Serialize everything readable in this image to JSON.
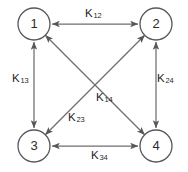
{
  "diagram": {
    "type": "graph",
    "background_color": "#ffffff",
    "node_stroke_color": "#58585a",
    "edge_color": "#6e6e70",
    "label_color": "#1f1f1f",
    "nodes": [
      {
        "id": "1",
        "label": "1",
        "cx": 34,
        "cy": 24,
        "r": 16
      },
      {
        "id": "2",
        "label": "2",
        "cx": 156,
        "cy": 24,
        "r": 16
      },
      {
        "id": "3",
        "label": "3",
        "cx": 34,
        "cy": 146,
        "r": 16
      },
      {
        "id": "4",
        "label": "4",
        "cx": 156,
        "cy": 146,
        "r": 16
      }
    ],
    "edges": [
      {
        "id": "k12",
        "from": "1",
        "to": "2",
        "base": "K",
        "sub": "12",
        "label": "K12",
        "direction": "bidirectional"
      },
      {
        "id": "k13",
        "from": "1",
        "to": "3",
        "base": "K",
        "sub": "13",
        "label": "K13",
        "direction": "bidirectional"
      },
      {
        "id": "k24",
        "from": "2",
        "to": "4",
        "base": "K",
        "sub": "24",
        "label": "K24",
        "direction": "bidirectional"
      },
      {
        "id": "k14",
        "from": "1",
        "to": "4",
        "base": "K",
        "sub": "14",
        "label": "K14",
        "direction": "bidirectional"
      },
      {
        "id": "k23",
        "from": "2",
        "to": "3",
        "base": "K",
        "sub": "23",
        "label": "K23",
        "direction": "bidirectional"
      },
      {
        "id": "k34",
        "from": "3",
        "to": "4",
        "base": "K",
        "sub": "34",
        "label": "K34",
        "direction": "bidirectional"
      }
    ]
  }
}
